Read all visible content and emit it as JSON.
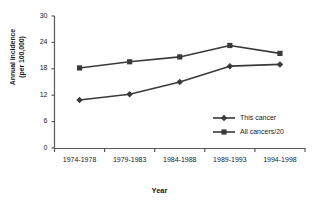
{
  "chart_data": {
    "type": "line",
    "title": "",
    "xlabel": "Year",
    "ylabel": "Annual incidence (per 100,000)",
    "ylabel_line1": "Annual incidence",
    "ylabel_line2": "(per 100,000)",
    "categories": [
      "1974-1978",
      "1979-1983",
      "1984-1988",
      "1989-1993",
      "1994-1998"
    ],
    "yticks": [
      0,
      6,
      12,
      18,
      24,
      30
    ],
    "ylim": [
      0,
      30
    ],
    "grid": false,
    "legend_position": "inside-lower-right",
    "series": [
      {
        "name": "This cancer",
        "marker": "diamond",
        "color": "#3a3a3a",
        "values": [
          10.9,
          12.2,
          15.0,
          18.6,
          19.0
        ]
      },
      {
        "name": "All cancers/20",
        "marker": "square",
        "color": "#3a3a3a",
        "values": [
          18.2,
          19.6,
          20.7,
          23.3,
          21.5
        ]
      }
    ]
  },
  "colors": {
    "axis": "#595959",
    "line": "#3a3a3a",
    "text": "#1a1a1a",
    "background": "#ffffff"
  }
}
